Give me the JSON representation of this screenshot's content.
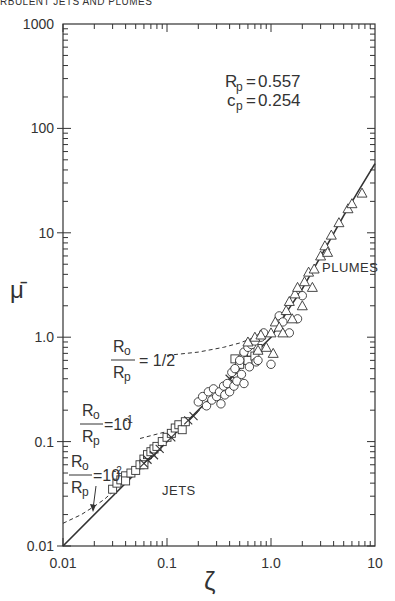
{
  "page": {
    "running_header": "RBULENT JETS AND PLUMES"
  },
  "chart_data": {
    "type": "scatter",
    "title": "",
    "xlabel": "ζ",
    "ylabel": "μ̄",
    "xscale": "log",
    "yscale": "log",
    "xlim": [
      0.01,
      10
    ],
    "ylim": [
      0.01,
      1000
    ],
    "x_ticks": [
      {
        "value": 0.01,
        "label": "0.01"
      },
      {
        "value": 0.1,
        "label": "0.1"
      },
      {
        "value": 1,
        "label": "1.0"
      },
      {
        "value": 10,
        "label": "10"
      }
    ],
    "y_ticks": [
      {
        "value": 0.01,
        "label": "0.01"
      },
      {
        "value": 0.1,
        "label": "0.1"
      },
      {
        "value": 1,
        "label": "1.0"
      },
      {
        "value": 10,
        "label": "10"
      },
      {
        "value": 100,
        "label": "100"
      },
      {
        "value": 1000,
        "label": "1000"
      }
    ],
    "grid": false,
    "parameters": {
      "line1": {
        "symbol": "R",
        "sub": "p",
        "value": "0.557"
      },
      "line2": {
        "symbol": "c",
        "sub": "p",
        "value": "0.254"
      }
    },
    "region_labels": {
      "plumes": "PLUMES",
      "jets": "JETS"
    },
    "curve_labels": [
      {
        "num": "R",
        "num_sub": "o",
        "den": "R",
        "den_sub": "p",
        "eq": "= 1/2"
      },
      {
        "num": "R",
        "num_sub": "o",
        "den": "R",
        "den_sub": "p",
        "eq": "=10",
        "exp": "-1"
      },
      {
        "num": "R",
        "num_sub": "o",
        "den": "R",
        "den_sub": "p",
        "eq": "=10",
        "exp": "-2"
      }
    ],
    "series": [
      {
        "name": "universal-curve",
        "kind": "solid-line",
        "points": [
          [
            0.01,
            0.01
          ],
          [
            0.03,
            0.03
          ],
          [
            0.1,
            0.1
          ],
          [
            0.3,
            0.3
          ],
          [
            0.6,
            0.6
          ],
          [
            1.0,
            1.0
          ],
          [
            1.5,
            1.9
          ],
          [
            2,
            2.9
          ],
          [
            3,
            5.9
          ],
          [
            5,
            14.6
          ],
          [
            7,
            25.6
          ],
          [
            10,
            46
          ]
        ]
      },
      {
        "name": "Ro/Rp=1/2",
        "kind": "dashed-line",
        "points": [
          [
            0.1,
            0.67
          ],
          [
            0.2,
            0.72
          ],
          [
            0.35,
            0.8
          ],
          [
            0.5,
            0.88
          ],
          [
            0.7,
            1.0
          ],
          [
            0.9,
            1.15
          ]
        ]
      },
      {
        "name": "Ro/Rp=1e-1",
        "kind": "dashed-line",
        "points": [
          [
            0.055,
            0.107
          ],
          [
            0.1,
            0.125
          ],
          [
            0.15,
            0.155
          ],
          [
            0.22,
            0.21
          ],
          [
            0.3,
            0.29
          ],
          [
            0.4,
            0.4
          ]
        ]
      },
      {
        "name": "Ro/Rp=1e-2",
        "kind": "dashed-line",
        "points": [
          [
            0.01,
            0.0165
          ],
          [
            0.015,
            0.02
          ],
          [
            0.02,
            0.024
          ],
          [
            0.025,
            0.028
          ],
          [
            0.03,
            0.033
          ]
        ]
      },
      {
        "name": "jets-squares",
        "marker": "square",
        "points": [
          [
            0.03,
            0.035
          ],
          [
            0.033,
            0.04
          ],
          [
            0.036,
            0.043
          ],
          [
            0.04,
            0.047
          ],
          [
            0.04,
            0.042
          ],
          [
            0.045,
            0.05
          ],
          [
            0.05,
            0.053
          ],
          [
            0.055,
            0.06
          ],
          [
            0.06,
            0.068
          ],
          [
            0.06,
            0.06
          ],
          [
            0.065,
            0.075
          ],
          [
            0.07,
            0.08
          ],
          [
            0.075,
            0.085
          ],
          [
            0.08,
            0.09
          ],
          [
            0.09,
            0.1
          ],
          [
            0.1,
            0.11
          ],
          [
            0.11,
            0.12
          ],
          [
            0.12,
            0.135
          ],
          [
            0.13,
            0.145
          ],
          [
            0.14,
            0.13
          ],
          [
            0.15,
            0.155
          ],
          [
            0.45,
            0.62
          ],
          [
            0.5,
            0.55
          ],
          [
            0.55,
            0.65
          ],
          [
            0.6,
            0.6
          ],
          [
            0.65,
            0.72
          ],
          [
            0.7,
            0.66
          ],
          [
            0.75,
            0.78
          ]
        ]
      },
      {
        "name": "jets-crosses",
        "marker": "cross",
        "points": [
          [
            0.06,
            0.062
          ],
          [
            0.065,
            0.067
          ],
          [
            0.075,
            0.074
          ],
          [
            0.085,
            0.085
          ],
          [
            0.11,
            0.11
          ],
          [
            0.16,
            0.16
          ],
          [
            0.18,
            0.175
          ],
          [
            0.4,
            0.4
          ],
          [
            0.43,
            0.42
          ]
        ]
      },
      {
        "name": "circles",
        "marker": "circle",
        "points": [
          [
            0.2,
            0.24
          ],
          [
            0.22,
            0.27
          ],
          [
            0.24,
            0.22
          ],
          [
            0.25,
            0.3
          ],
          [
            0.27,
            0.25
          ],
          [
            0.28,
            0.32
          ],
          [
            0.3,
            0.27
          ],
          [
            0.32,
            0.3
          ],
          [
            0.33,
            0.23
          ],
          [
            0.35,
            0.34
          ],
          [
            0.36,
            0.28
          ],
          [
            0.38,
            0.36
          ],
          [
            0.4,
            0.3
          ],
          [
            0.42,
            0.46
          ],
          [
            0.44,
            0.34
          ],
          [
            0.45,
            0.5
          ],
          [
            0.47,
            0.38
          ],
          [
            0.5,
            0.6
          ],
          [
            0.52,
            0.44
          ],
          [
            0.55,
            0.72
          ],
          [
            0.55,
            0.36
          ],
          [
            0.6,
            0.8
          ],
          [
            0.62,
            0.52
          ],
          [
            0.65,
            0.85
          ],
          [
            0.7,
            0.92
          ],
          [
            0.72,
            0.58
          ],
          [
            0.75,
            0.6
          ],
          [
            0.8,
            1.0
          ],
          [
            0.85,
            1.1
          ],
          [
            1.2,
            1.6
          ],
          [
            1.3,
            1.4
          ],
          [
            1.5,
            1.1
          ],
          [
            1.8,
            1.5
          ],
          [
            2.0,
            2.5
          ],
          [
            1.0,
            0.55
          ]
        ]
      },
      {
        "name": "plumes-triangles",
        "marker": "triangle",
        "points": [
          [
            0.6,
            0.9
          ],
          [
            0.7,
            1.0
          ],
          [
            0.75,
            0.75
          ],
          [
            0.8,
            1.05
          ],
          [
            0.9,
            0.8
          ],
          [
            1.0,
            1.1
          ],
          [
            1.05,
            0.7
          ],
          [
            1.1,
            1.4
          ],
          [
            1.2,
            1.25
          ],
          [
            1.3,
            1.1
          ],
          [
            1.4,
            1.8
          ],
          [
            1.5,
            2.2
          ],
          [
            1.6,
            1.5
          ],
          [
            1.7,
            2.6
          ],
          [
            1.8,
            3.0
          ],
          [
            2.0,
            2.0
          ],
          [
            2.1,
            3.4
          ],
          [
            2.3,
            4.2
          ],
          [
            2.5,
            3.0
          ],
          [
            2.6,
            4.5
          ],
          [
            3.0,
            6.0
          ],
          [
            3.3,
            7.5
          ],
          [
            3.5,
            6.5
          ],
          [
            3.8,
            9.5
          ],
          [
            4.5,
            12.5
          ],
          [
            5.5,
            17
          ],
          [
            6.0,
            19
          ],
          [
            7.5,
            24
          ]
        ]
      }
    ]
  }
}
